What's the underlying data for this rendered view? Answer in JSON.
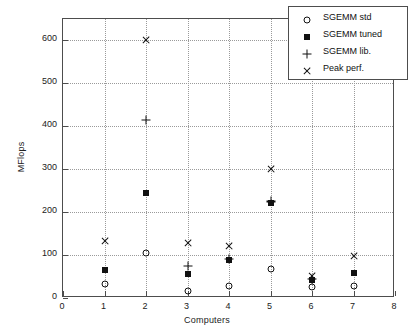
{
  "chart_data": {
    "type": "scatter",
    "title": "",
    "xlabel": "Computers",
    "ylabel": "MFlops",
    "xlim": [
      0,
      8
    ],
    "ylim": [
      0,
      650
    ],
    "xticks": [
      0,
      1,
      2,
      3,
      4,
      5,
      6,
      7,
      8
    ],
    "yticks": [
      0,
      100,
      200,
      300,
      400,
      500,
      600
    ],
    "grid": true,
    "legend_position": "top-right",
    "x": [
      1,
      2,
      3,
      4,
      5,
      6,
      7
    ],
    "series": [
      {
        "name": "SGEMM std",
        "marker": "circle",
        "values": [
          33,
          105,
          17,
          28,
          68,
          26,
          28
        ]
      },
      {
        "name": "SGEMM tuned",
        "marker": "square",
        "values": [
          65,
          245,
          57,
          88,
          222,
          42,
          58
        ]
      },
      {
        "name": "SGEMM lib.",
        "marker": "plus",
        "values": [
          null,
          415,
          75,
          92,
          225,
          45,
          null
        ]
      },
      {
        "name": "Peak perf.",
        "marker": "cross",
        "values": [
          132,
          600,
          128,
          122,
          300,
          52,
          98
        ]
      }
    ]
  },
  "legend": {
    "items": [
      {
        "label": "SGEMM std",
        "marker": "circle"
      },
      {
        "label": "SGEMM tuned",
        "marker": "square"
      },
      {
        "label": "SGEMM lib.",
        "marker": "plus"
      },
      {
        "label": "Peak perf.",
        "marker": "cross"
      }
    ]
  },
  "axes": {
    "ylabel": "MFlops",
    "xlabel": "Computers",
    "ytick_labels": [
      "0",
      "100",
      "200",
      "300",
      "400",
      "500",
      "600"
    ],
    "xtick_labels": [
      "0",
      "1",
      "2",
      "3",
      "4",
      "5",
      "6",
      "7",
      "8"
    ]
  },
  "colors": {
    "marker": "#111111",
    "axis": "#4d4d4d",
    "grid": "#9a9a9a",
    "background": "#ffffff"
  }
}
